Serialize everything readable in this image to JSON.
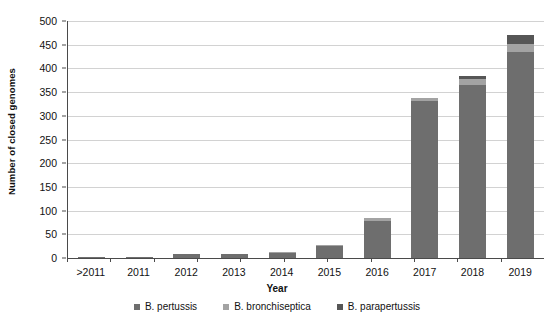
{
  "chart_data": {
    "type": "bar",
    "stacked": true,
    "title": "",
    "xlabel": "Year",
    "ylabel": "Number of closed genomes",
    "categories": [
      ">2011",
      "2011",
      "2012",
      "2013",
      "2014",
      "2015",
      "2016",
      "2017",
      "2018",
      "2019"
    ],
    "series": [
      {
        "name": "B. pertussis",
        "color": "#6e6e6e",
        "values": [
          1,
          3,
          8,
          9,
          11,
          25,
          78,
          331,
          365,
          435
        ]
      },
      {
        "name": "B. bronchiseptica",
        "color": "#a3a3a3",
        "values": [
          0,
          0,
          0,
          0,
          1,
          2,
          7,
          6,
          13,
          17
        ]
      },
      {
        "name": "B. parapertussis",
        "color": "#565656",
        "values": [
          0,
          0,
          0,
          0,
          0,
          0,
          0,
          0,
          5,
          18
        ]
      }
    ],
    "totals": [
      1,
      3,
      8,
      9,
      12,
      27,
      85,
      337,
      383,
      470
    ],
    "ylim": [
      0,
      500
    ],
    "yticks": [
      0,
      50,
      100,
      150,
      200,
      250,
      300,
      350,
      400,
      450,
      500
    ],
    "ytick_labels": [
      "0",
      "50",
      "100",
      "150",
      "200",
      "250",
      "300",
      "350",
      "400",
      "450",
      "500"
    ],
    "grid": true,
    "legend_position": "bottom"
  }
}
